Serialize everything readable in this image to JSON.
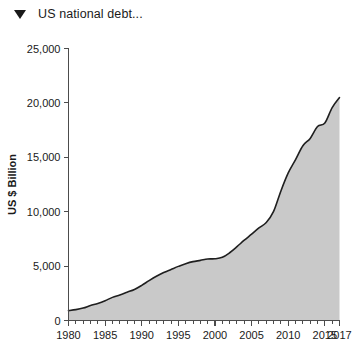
{
  "header": {
    "title": "US national debt...",
    "collapse_icon": "triangle-down-icon"
  },
  "chart_data": {
    "type": "area",
    "title": "US national debt...",
    "xlabel": "",
    "ylabel": "US $ Billion",
    "xlim": [
      1980,
      2017
    ],
    "ylim": [
      0,
      25000
    ],
    "grid": false,
    "legend": null,
    "fill_color": "#c9c9c9",
    "line_color": "#1f1f1f",
    "y_ticks": [
      0,
      5000,
      10000,
      15000,
      20000,
      25000
    ],
    "y_tick_labels": [
      "0",
      "5,000",
      "10,000",
      "15,000",
      "20,000",
      "25,000"
    ],
    "x_ticks": [
      1980,
      1985,
      1990,
      1995,
      2000,
      2005,
      2010,
      2015,
      2017
    ],
    "x_tick_labels": [
      "1980",
      "1985",
      "1990",
      "1995",
      "2000",
      "2005",
      "2010",
      "2015",
      "2017"
    ],
    "x_minor_tick_step": 1,
    "x": [
      1980,
      1981,
      1982,
      1983,
      1984,
      1985,
      1986,
      1987,
      1988,
      1989,
      1990,
      1991,
      1992,
      1993,
      1994,
      1995,
      1996,
      1997,
      1998,
      1999,
      2000,
      2001,
      2002,
      2003,
      2004,
      2005,
      2006,
      2007,
      2008,
      2009,
      2010,
      2011,
      2012,
      2013,
      2014,
      2015,
      2016,
      2017
    ],
    "values": [
      909,
      998,
      1142,
      1377,
      1573,
      1823,
      2125,
      2350,
      2602,
      2857,
      3233,
      3665,
      4065,
      4411,
      4693,
      4974,
      5225,
      5413,
      5526,
      5656,
      5674,
      5807,
      6228,
      6783,
      7379,
      7933,
      8507,
      9008,
      10025,
      11910,
      13562,
      14790,
      16066,
      16738,
      17824,
      18151,
      19573,
      20493
    ],
    "series_name": "US national debt"
  }
}
